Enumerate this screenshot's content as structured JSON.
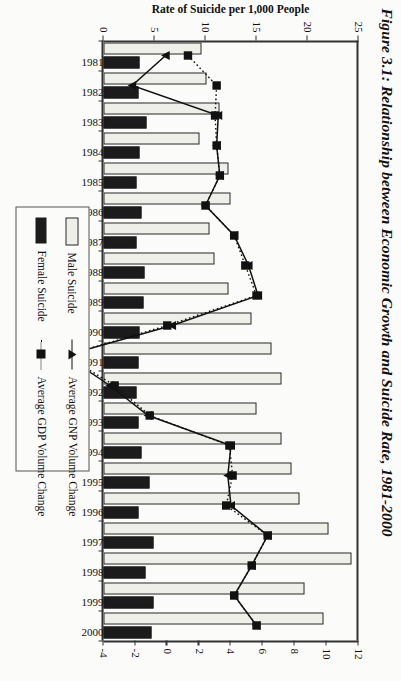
{
  "title": "Figure 3.1: Relationship between Economic Growth and Suicide Rate, 1981-2000",
  "axes": {
    "rate_axis_label": "Rate of Suicide per 1,000 People",
    "rate_ticks": [
      "25",
      "20",
      "15",
      "10",
      "5",
      "0"
    ],
    "growth_ticks": [
      "12",
      "10",
      "8",
      "6",
      "4",
      "2",
      "0",
      "-2",
      "-4"
    ]
  },
  "legend": {
    "items": [
      {
        "label": "Male Suicide",
        "key": "bar-white"
      },
      {
        "label": "Female Suicide",
        "key": "bar-black"
      },
      {
        "label": "Average GNP Volume Change",
        "key": "line-solid-triangle"
      },
      {
        "label": "Average GDP Volume Change",
        "key": "line-dotted-square"
      }
    ]
  },
  "chart_data": {
    "type": "bar",
    "title": "Figure 3.1: Relationship between Economic Growth and Suicide Rate, 1981-2000",
    "xlabel": "",
    "ylabel": "Rate of Suicide per 1,000 People",
    "y2label": "Average Volume Change (%)",
    "ylim": [
      0,
      25
    ],
    "y2lim": [
      -4,
      12
    ],
    "grid": false,
    "legend_position": "center-right",
    "categories": [
      "1981",
      "1982",
      "1983",
      "1984",
      "1985",
      "1986",
      "1987",
      "1988",
      "1989",
      "1990",
      "1991",
      "1992",
      "1993",
      "1994",
      "1995",
      "1996",
      "1997",
      "1998",
      "1999",
      "2000"
    ],
    "series": [
      {
        "name": "Male Suicide",
        "type": "bar",
        "axis": "left",
        "values": [
          9.6,
          10.1,
          11.4,
          9.4,
          12.3,
          12.5,
          10.4,
          10.9,
          12.3,
          14.5,
          16.5,
          17.5,
          15.0,
          17.5,
          18.4,
          19.2,
          22.1,
          24.3,
          19.7,
          21.6
        ]
      },
      {
        "name": "Female Suicide",
        "type": "bar",
        "axis": "left",
        "values": [
          3.5,
          3.4,
          4.2,
          3.5,
          3.2,
          3.7,
          3.2,
          4.0,
          3.9,
          3.5,
          3.4,
          3.2,
          3.4,
          3.7,
          4.5,
          3.4,
          4.9,
          4.1,
          4.9,
          4.7
        ]
      },
      {
        "name": "Average GNP Volume Change",
        "type": "line",
        "axis": "right",
        "values": [
          -0.1,
          -2.2,
          3.2,
          3.1,
          3.3,
          2.4,
          4.2,
          5.1,
          5.7,
          0.3,
          -6.4,
          -3.6,
          -1.2,
          4.0,
          3.8,
          4.0,
          6.3,
          5.3,
          4.2,
          5.6
        ]
      },
      {
        "name": "Average GDP Volume Change",
        "type": "line",
        "axis": "right",
        "values": [
          1.3,
          3.1,
          3.0,
          3.1,
          3.3,
          2.4,
          4.2,
          4.9,
          5.6,
          0.0,
          -6.4,
          -3.3,
          -1.1,
          3.9,
          4.1,
          3.7,
          6.3,
          5.3,
          4.2,
          5.6
        ]
      }
    ]
  }
}
